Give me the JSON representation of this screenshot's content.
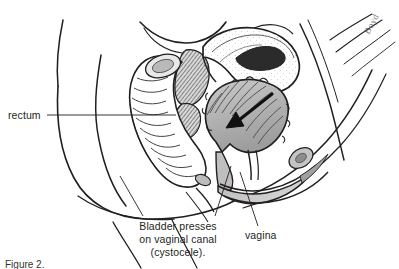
{
  "figure": {
    "title": "Bladder presses on vaginal canal (cystocele)",
    "background_color": "#ffffff",
    "ink_color": "#231f20",
    "shade_color": "#a9a9a9",
    "signature": "Boyd"
  },
  "labels": {
    "rectum": "rectum",
    "vagina": "vagina",
    "cystocele_line1": "Bladder presses",
    "cystocele_line2": "on vaginal canal",
    "cystocele_line3": "(cystocele)."
  },
  "caption": {
    "cut_off_text": "Figure 2."
  },
  "structures": [
    {
      "name": "body-outline",
      "label": "",
      "shaded": false
    },
    {
      "name": "uterus",
      "label": "",
      "shaded": false
    },
    {
      "name": "rectum",
      "label": "rectum",
      "shaded": false
    },
    {
      "name": "bladder",
      "label": "Bladder presses on vaginal canal (cystocele).",
      "shaded": true
    },
    {
      "name": "vaginal-canal",
      "label": "vagina",
      "shaded": true
    },
    {
      "name": "sacrum",
      "label": "",
      "shaded": true
    },
    {
      "name": "pubic-bone",
      "label": "",
      "shaded": true
    },
    {
      "name": "pressure-arrow",
      "label": "",
      "shaded": false
    }
  ]
}
